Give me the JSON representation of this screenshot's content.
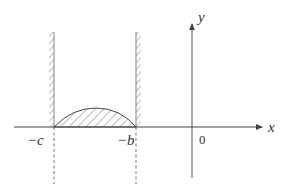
{
  "diagram": {
    "type": "coordinate-sketch",
    "axes": {
      "x_label": "x",
      "y_label": "y",
      "origin_label": "0"
    },
    "points": {
      "left_wall_label": "−c",
      "right_wall_label": "−b"
    },
    "colors": {
      "line": "#555555",
      "hatch": "#666666",
      "background": "#ffffff"
    }
  }
}
